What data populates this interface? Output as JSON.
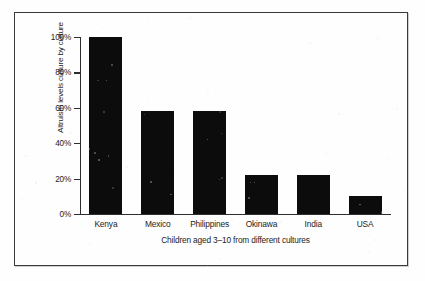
{
  "figure": {
    "frame_color": "#3a3a3c",
    "background_color": "#fefefe",
    "bar_color": "#0c0c0d",
    "axis_color": "#2e2e30"
  },
  "chart_data": {
    "type": "bar",
    "title": "",
    "subtitle": "",
    "categories": [
      "Kenya",
      "Mexico",
      "Philippines",
      "Okinawa",
      "India",
      "USA"
    ],
    "values": [
      100,
      58,
      58,
      22,
      22,
      10
    ],
    "xlabel": "Children aged 3–10 from different cultures",
    "ylabel": "Altruism levels culture by culture",
    "ylim": [
      0,
      100
    ],
    "yticks": [
      0,
      20,
      40,
      60,
      80,
      100
    ],
    "ytick_labels": [
      "0%",
      "20%",
      "40%",
      "60%",
      "80%",
      "100%"
    ],
    "grid": false,
    "legend": false,
    "legend_position": "none",
    "series": [
      {
        "name": "Altruism level",
        "values": [
          100,
          58,
          58,
          22,
          22,
          10
        ]
      }
    ],
    "annotations": []
  }
}
